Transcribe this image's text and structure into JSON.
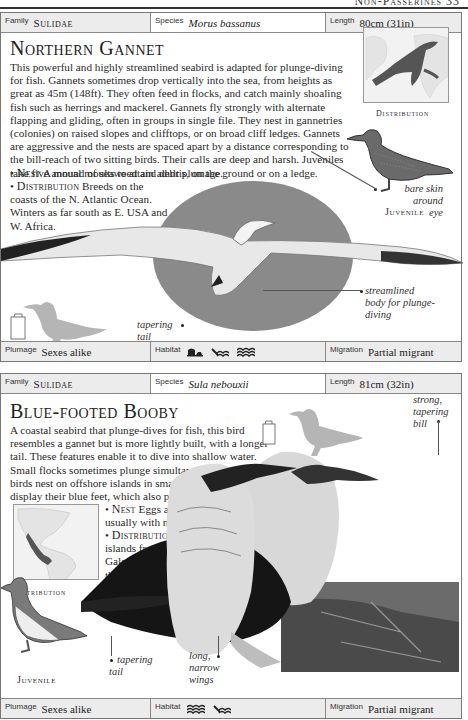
{
  "running_head": {
    "text": "Non-Passerines  33"
  },
  "entries": [
    {
      "family_label": "Family",
      "family": "Sulidae",
      "species_label": "Species",
      "species": "Morus bassanus",
      "length_label": "Length",
      "length": "80cm (31in)",
      "title": "Northern Gannet",
      "description": "This powerful and highly streamlined seabird is adapted for plunge-diving for fish. Gannets sometimes drop vertically into the sea, from heights as great as 45m (148ft). They often feed in flocks, and catch mainly shoaling fish such as herrings and mackerel. Gannets fly strongly with alternate flapping and gliding, often in groups in single file. They nest in gannetries (colonies) on raised slopes and clifftops, or on broad cliff ledges. Gannets are aggressive and the nests are spaced apart by a distance corresponding to the bill-reach of two sitting birds. Their calls are deep and harsh. Juveniles take five annual moults to attain adult plumage.",
      "nest_label": "Nest",
      "nest": "A mound of seaweed and debris, on the ground or on a ledge.",
      "distribution_label": "Distribution",
      "distribution_lines": [
        "Breeds on the",
        "coasts of the N. Atlantic Ocean.",
        "Winters as far south as E. USA and",
        "W. Africa."
      ],
      "map_caption": "Distribution",
      "juvenile_caption": "Juvenile",
      "annotations": {
        "eye": [
          "bare skin",
          "around",
          "eye"
        ],
        "body": [
          "streamlined",
          "body for plunge-",
          "diving"
        ],
        "tail": [
          "tapering",
          "tail"
        ]
      },
      "plumage_label": "Plumage",
      "plumage": "Sexes alike",
      "habitat_label": "Habitat",
      "habitat_icons": [
        "cliff-coast-icon",
        "rocky-shore-icon",
        "open-sea-icon"
      ],
      "migration_label": "Migration",
      "migration": "Partial migrant",
      "colors": {
        "circle": "#8a8a8a",
        "silhouette": "#b5b5b5"
      }
    },
    {
      "family_label": "Family",
      "family": "Sulidae",
      "species_label": "Species",
      "species": "Sula nebouxii",
      "length_label": "Length",
      "length": "81cm (32in)",
      "title": "Blue-footed Booby",
      "description_lines": [
        "A coastal seabird that plunge-dives for fish, this bird",
        "resembles a gannet but is more lightly built, with a longer",
        "tail. These features enable it to dive into shallow water.",
        "Small flocks sometimes plunge simultaneously from a height. The",
        "birds nest on offshore islands in small colonies. In courtship they",
        "display their blue feet, which also provide warmth for incubation."
      ],
      "nest_label": "Nest",
      "nest_lines": [
        "Eggs are placed on flat ground,",
        "usually with no nest materials."
      ],
      "distribution_label": "Distribution",
      "distribution_lines": [
        "E. Pacific on",
        "islands from N.W. Mexico to",
        "Galapagos and along",
        "the South American",
        "coast to N. Peru."
      ],
      "map_caption": "Distribution",
      "juvenile_caption": "Juvenile",
      "annotations": {
        "bill": [
          "strong,",
          "tapering",
          "bill"
        ],
        "tail": [
          "tapering",
          "tail"
        ],
        "wings": [
          "long,",
          "narrow",
          "wings"
        ]
      },
      "plumage_label": "Plumage",
      "plumage": "Sexes alike",
      "habitat_label": "Habitat",
      "habitat_icons": [
        "open-sea-icon",
        "rocky-shore-icon"
      ],
      "migration_label": "Migration",
      "migration": "Partial migrant"
    }
  ]
}
